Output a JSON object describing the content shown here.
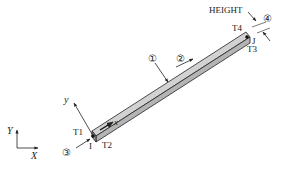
{
  "diagram": {
    "type": "beam-element",
    "nodes": {
      "i": "I",
      "j": "J"
    },
    "corners": {
      "t1": "T1",
      "t2": "T2",
      "t3": "T3",
      "t4": "T4"
    },
    "local_axes": {
      "x": "x",
      "y": "y"
    },
    "global_axes": {
      "x": "X",
      "y": "Y"
    },
    "height_label": "HEIGHT",
    "load_markers": {
      "m1": "①",
      "m2": "②",
      "m3": "③",
      "m4": "④"
    },
    "colors": {
      "beam_fill": "#b4b4b4",
      "beam_top": "#d2d2d2",
      "stroke": "#222222"
    }
  }
}
